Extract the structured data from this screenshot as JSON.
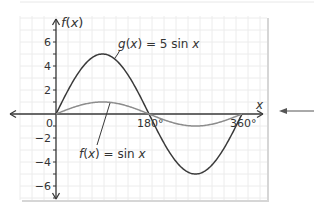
{
  "chart_data": {
    "type": "line",
    "title": "",
    "xlabel": "x",
    "ylabel": "f(x)",
    "xlim": [
      -70,
      400
    ],
    "ylim": [
      -7,
      8
    ],
    "grid": true,
    "x_ticks": [
      {
        "value": 0,
        "label": "0"
      },
      {
        "value": 180,
        "label": "180°"
      },
      {
        "value": 360,
        "label": "360°"
      }
    ],
    "y_ticks": [
      {
        "value": 6,
        "label": "6"
      },
      {
        "value": 4,
        "label": "4"
      },
      {
        "value": 2,
        "label": "2"
      },
      {
        "value": -2,
        "label": "−2"
      },
      {
        "value": -4,
        "label": "−4"
      },
      {
        "value": -6,
        "label": "−6"
      }
    ],
    "series": [
      {
        "name": "g(x) = 5 sin x",
        "amplitude": 5,
        "function": "5*sin(x)",
        "x_range": [
          0,
          360
        ],
        "color": "#3a3a3a"
      },
      {
        "name": "f(x) = sin x",
        "amplitude": 1,
        "function": "sin(x)",
        "x_range": [
          0,
          360
        ],
        "color": "#8c8c8c"
      }
    ],
    "annotations": [
      {
        "text_parts": [
          "g",
          "(",
          "x",
          ") = 5 sin ",
          "x"
        ],
        "points_to": "g(x) = 5 sin x",
        "near": [
          90,
          5
        ]
      },
      {
        "text_parts": [
          "f",
          "(",
          "x",
          ") = sin ",
          "x"
        ],
        "points_to": "f(x) = sin x",
        "near": [
          90,
          1
        ]
      }
    ],
    "legend": "none"
  },
  "colors": {
    "axis": "#3a3a3a",
    "grid": "#ececec",
    "g_curve": "#3a3a3a",
    "f_curve": "#8c8c8c",
    "f_label": "#8c8c8c",
    "pointer_arrow": "#555555"
  },
  "labels": {
    "y_axis": "f(x)",
    "x_axis": "x",
    "g_label": "g(x) = 5 sin x",
    "f_label": "f(x) = sin x"
  }
}
